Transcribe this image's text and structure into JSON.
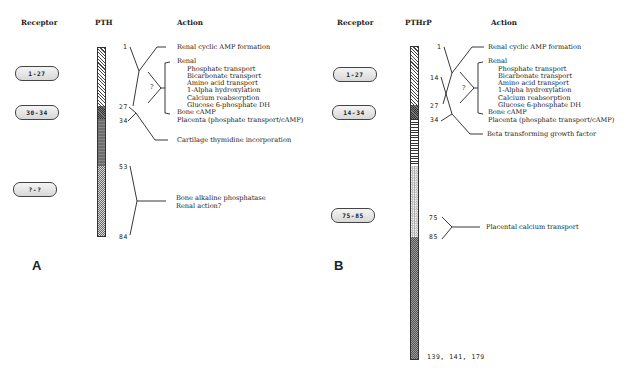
{
  "panels": {
    "A": {
      "letter": "A",
      "headers": {
        "receptor": "Receptor",
        "molecule": "PTH",
        "action": "Action"
      },
      "receptors": [
        "1-27",
        "30-34",
        "?-?"
      ],
      "residue_labels": [
        "1",
        "27",
        "34",
        "53",
        "84"
      ],
      "actions": {
        "renal_camp": "Renal cyclic AMP formation",
        "renal": "Renal",
        "renal_items": [
          "Phosphate transport",
          "Bicarbonate transport",
          "Amino acid  transport",
          "1-Alpha hydroxylation",
          "Calcium reabsorption",
          "Glucose 6-phosphate DH"
        ],
        "bone_camp": "Bone cAMP",
        "placenta": "Placenta (phosphate transport/cAMP)",
        "question": "?",
        "cartilage": "Cartilage thymidine incorporation",
        "bone_alk": "Bone alkaline phosphatase",
        "renal_action": "Renal action?"
      },
      "segments": [
        {
          "from": 1,
          "to": 27,
          "pattern": "diagonal-hatch"
        },
        {
          "from": 27,
          "to": 34,
          "pattern": "crosshatch"
        },
        {
          "from": 34,
          "to": 53,
          "pattern": "dark"
        },
        {
          "from": 53,
          "to": 84,
          "pattern": "checker"
        }
      ]
    },
    "B": {
      "letter": "B",
      "headers": {
        "receptor": "Receptor",
        "molecule": "PTHrP",
        "action": "Action"
      },
      "receptors": [
        "1-27",
        "14-34",
        "75-85"
      ],
      "residue_labels": [
        "1",
        "14",
        "27",
        "34",
        "75",
        "85"
      ],
      "terminal_label": "139, 141, 179",
      "actions": {
        "renal_camp": "Renal cyclic AMP formation",
        "renal": "Renal",
        "renal_items": [
          "Phosphate transport",
          "Bicarbonate transport",
          "Amino acid  transport",
          "1-Alpha hydroxylation",
          "Calcium reabsorption",
          "Glucose 6-phosphate DH"
        ],
        "bone_camp": "Bone cAMP",
        "placenta": "Placenta (phosphate transport/cAMP)",
        "question": "?",
        "beta_tgf": "Beta transforming  growth factor",
        "placental_ca": "Placental calcium transport"
      },
      "segments": [
        {
          "from": 1,
          "to": 27,
          "pattern": "diagonal-hatch"
        },
        {
          "from": 27,
          "to": 34,
          "pattern": "crosshatch"
        },
        {
          "from": 34,
          "to": 53,
          "pattern": "horizontal-stripes"
        },
        {
          "from": 53,
          "to": 85,
          "pattern": "dots"
        },
        {
          "from": 85,
          "to": 179,
          "pattern": "dark-checker"
        }
      ]
    }
  }
}
